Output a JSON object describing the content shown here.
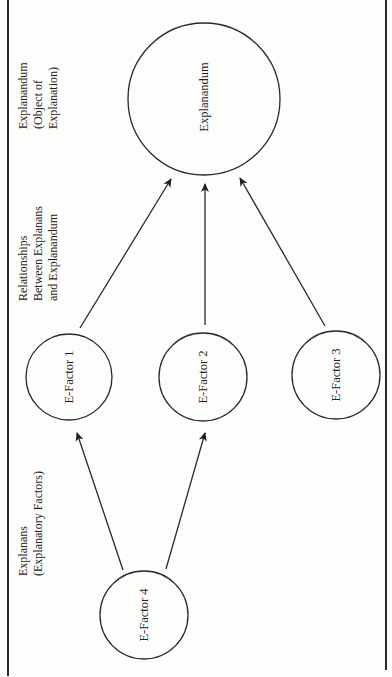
{
  "diagram": {
    "orientation": "rotated-90-ccw",
    "columns": [
      {
        "id": "explanandum-column",
        "lines": [
          "Explanandum",
          "(Object of",
          "Explanation)"
        ]
      },
      {
        "id": "relationships-column",
        "lines": [
          "Relationships",
          "Between Explanans",
          "and Explanandum"
        ]
      },
      {
        "id": "explanans-column",
        "lines": [
          "Explanans",
          "(Explanatory Factors)"
        ]
      }
    ],
    "nodes": {
      "explanandum": {
        "label": "Explanandum"
      },
      "ef1": {
        "label": "E-Factor 1"
      },
      "ef2": {
        "label": "E-Factor 2"
      },
      "ef3": {
        "label": "E-Factor 3"
      },
      "ef4": {
        "label": "E-Factor 4"
      }
    },
    "edges": [
      {
        "from": "E-Factor 1",
        "to": "Explanandum"
      },
      {
        "from": "E-Factor 2",
        "to": "Explanandum"
      },
      {
        "from": "E-Factor 3",
        "to": "Explanandum"
      },
      {
        "from": "E-Factor 4",
        "to": "E-Factor 1"
      },
      {
        "from": "E-Factor 4",
        "to": "E-Factor 2"
      }
    ],
    "colors": {
      "stroke": "#2a2a2a",
      "background": "#fdfdfb"
    }
  }
}
